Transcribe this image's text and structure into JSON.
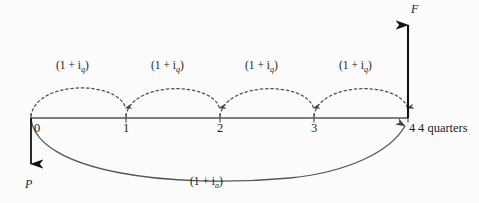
{
  "figure": {
    "type": "cash-flow-timeline",
    "background_color": "#fbfbfc",
    "line_color": "#4a4a52",
    "text_color": "#1b1b1b"
  },
  "timeline": {
    "axis_y": 118,
    "x_start": 31,
    "x_end": 408,
    "end_label": "4 quarters",
    "ticks": [
      {
        "label": "0",
        "x": 31
      },
      {
        "label": "1",
        "x": 126
      },
      {
        "label": "2",
        "x": 220
      },
      {
        "label": "3",
        "x": 314
      },
      {
        "label": "4",
        "x": 408
      }
    ]
  },
  "future_arrow": {
    "symbol": "F",
    "x": 408,
    "from_y": 118,
    "to_y": 22,
    "direction": "up",
    "label_x": 411,
    "label_y": 3
  },
  "present_arrow": {
    "symbol": "P",
    "x": 31,
    "from_y": 118,
    "to_y": 172,
    "direction": "down",
    "label_x": 25,
    "label_y": 178
  },
  "quarter_arcs": [
    {
      "label": "(1 + i",
      "sub": "q",
      "label_close": ")",
      "from": 31,
      "to": 126,
      "label_x": 56,
      "label_y": 60
    },
    {
      "label": "(1 + i",
      "sub": "q",
      "label_close": ")",
      "from": 126,
      "to": 220,
      "label_x": 151,
      "label_y": 60
    },
    {
      "label": "(1 + i",
      "sub": "q",
      "label_close": ")",
      "from": 220,
      "to": 314,
      "label_x": 245,
      "label_y": 60
    },
    {
      "label": "(1 + i",
      "sub": "q",
      "label_close": ")",
      "from": 314,
      "to": 408,
      "label_x": 339,
      "label_y": 60
    }
  ],
  "annual_arc": {
    "label": "(1 + i",
    "sub": "a",
    "label_close": ")",
    "from": 31,
    "to": 408,
    "label_x": 190,
    "label_y": 176,
    "style": "solid"
  }
}
